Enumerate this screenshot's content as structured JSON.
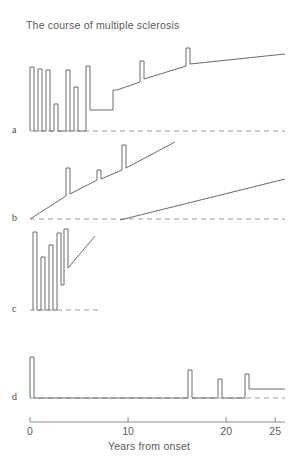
{
  "chart_title": "The course of multiple sclerosis",
  "panels": [
    {
      "id": "a",
      "label": "a"
    },
    {
      "id": "b",
      "label": "b"
    },
    {
      "id": "c",
      "label": "c"
    },
    {
      "id": "d",
      "label": "d"
    }
  ],
  "axis": {
    "caption": "Years from onset",
    "ticks": [
      {
        "value": 0,
        "label": "0"
      },
      {
        "value": 10,
        "label": "10"
      },
      {
        "value": 20,
        "label": "20"
      },
      {
        "value": 25,
        "label": "25"
      }
    ],
    "xmin": 0,
    "xmax": 26
  },
  "colors": {
    "curve": "#6b6b6b",
    "baseline": "#9a9a9a",
    "axis": "#8c8c8c",
    "text": "#5a5a5a",
    "background": "#ffffff"
  },
  "chart_data": {
    "type": "line",
    "title": "The course of multiple sclerosis",
    "xlabel": "Years from onset",
    "ylabel": "",
    "xlim": [
      0,
      26
    ],
    "grid": false,
    "legend": "none",
    "series": [
      {
        "name": "a",
        "panel": "a",
        "pattern": "relapsing-remitting becoming progressive",
        "baseline_y_px": 131,
        "points_px": [
          [
            30,
            131
          ],
          [
            30,
            67
          ],
          [
            34,
            67
          ],
          [
            34,
            131
          ],
          [
            38,
            131
          ],
          [
            38,
            69
          ],
          [
            42,
            69
          ],
          [
            42,
            131
          ],
          [
            46,
            131
          ],
          [
            46,
            70
          ],
          [
            50,
            70
          ],
          [
            50,
            131
          ],
          [
            54,
            131
          ],
          [
            54,
            104
          ],
          [
            58,
            104
          ],
          [
            58,
            131
          ],
          [
            66,
            131
          ],
          [
            66,
            70
          ],
          [
            70,
            70
          ],
          [
            70,
            131
          ],
          [
            74,
            131
          ],
          [
            74,
            87
          ],
          [
            78,
            87
          ],
          [
            78,
            131
          ],
          [
            86,
            131
          ],
          [
            86,
            66
          ],
          [
            90,
            66
          ],
          [
            90,
            110
          ],
          [
            113,
            110
          ],
          [
            113,
            90
          ],
          [
            117,
            90
          ],
          [
            140,
            82
          ],
          [
            140,
            61
          ],
          [
            144,
            61
          ],
          [
            144,
            79
          ],
          [
            186,
            66
          ],
          [
            186,
            48
          ],
          [
            190,
            48
          ],
          [
            190,
            64
          ],
          [
            285,
            54
          ]
        ]
      },
      {
        "name": "b",
        "panel": "b",
        "pattern": "progressive from onset with superimposed relapses",
        "baseline_y_px": 219,
        "points_px": [
          [
            30,
            219
          ],
          [
            66,
            196
          ],
          [
            66,
            168
          ],
          [
            70,
            168
          ],
          [
            70,
            194
          ],
          [
            97,
            180
          ],
          [
            97,
            170
          ],
          [
            101,
            170
          ],
          [
            101,
            179
          ],
          [
            122,
            170
          ],
          [
            122,
            145
          ],
          [
            126,
            145
          ],
          [
            126,
            168
          ],
          [
            175,
            142
          ]
        ]
      },
      {
        "name": "b2",
        "panel": "b",
        "pattern": "steadily progressive without relapses",
        "baseline_y_px": 219,
        "points_px": [
          [
            120,
            220
          ],
          [
            285,
            179
          ]
        ]
      },
      {
        "name": "c",
        "panel": "c",
        "pattern": "frequent early relapses with stepwise accumulating disability",
        "baseline_y_px": 310,
        "points_px": [
          [
            33,
            310
          ],
          [
            33,
            232
          ],
          [
            37,
            232
          ],
          [
            37,
            310
          ],
          [
            41,
            310
          ],
          [
            41,
            257
          ],
          [
            45,
            257
          ],
          [
            45,
            310
          ],
          [
            49,
            310
          ],
          [
            49,
            245
          ],
          [
            53,
            245
          ],
          [
            53,
            310
          ],
          [
            57,
            310
          ],
          [
            57,
            233
          ],
          [
            61,
            233
          ],
          [
            61,
            285
          ],
          [
            64,
            285
          ],
          [
            64,
            229
          ],
          [
            68,
            229
          ],
          [
            68,
            268
          ],
          [
            95,
            236
          ]
        ]
      },
      {
        "name": "d",
        "panel": "d",
        "pattern": "benign: isolated early relapse, long remission, late relapses with mild residual deficit",
        "baseline_y_px": 398,
        "points_px": [
          [
            30,
            398
          ],
          [
            30,
            357
          ],
          [
            34,
            357
          ],
          [
            34,
            398
          ],
          [
            188,
            398
          ],
          [
            188,
            370
          ],
          [
            192,
            370
          ],
          [
            192,
            398
          ],
          [
            218,
            398
          ],
          [
            218,
            379
          ],
          [
            222,
            379
          ],
          [
            222,
            398
          ],
          [
            245,
            398
          ],
          [
            245,
            374
          ],
          [
            249,
            374
          ],
          [
            249,
            389
          ],
          [
            285,
            389
          ]
        ]
      }
    ],
    "baselines_px": [
      {
        "panel": "a",
        "y": 131,
        "x_start": 30,
        "x_end": 285
      },
      {
        "panel": "b",
        "y": 219,
        "x_start": 30,
        "x_end": 285
      },
      {
        "panel": "c",
        "y": 310,
        "x_start": 30,
        "x_end": 98
      },
      {
        "panel": "d",
        "y": 398,
        "x_start": 30,
        "x_end": 285
      }
    ]
  }
}
